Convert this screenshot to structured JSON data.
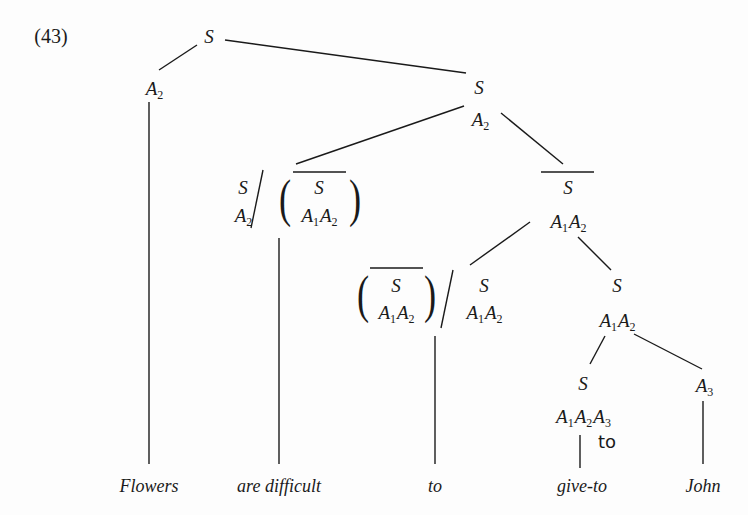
{
  "example_number": "(43)",
  "tree": {
    "root": {
      "cat": "S"
    },
    "left_A2": {
      "cat": "A",
      "sub": "2"
    },
    "s2": {
      "cat": "S",
      "feat": {
        "cat": "A",
        "sub": "2"
      }
    },
    "are_difficult_node": {
      "left": {
        "cat": "S",
        "feat": {
          "cat": "A",
          "sub": "2"
        }
      },
      "slash": "/",
      "paren_open": "(",
      "paren_close": ")",
      "inner": {
        "cat": "S",
        "overlined": true,
        "feat": [
          {
            "cat": "A",
            "sub": "1"
          },
          {
            "cat": "A",
            "sub": "2"
          }
        ]
      }
    },
    "sbar_node": {
      "cat": "S",
      "overlined": true,
      "feat": [
        {
          "cat": "A",
          "sub": "1"
        },
        {
          "cat": "A",
          "sub": "2"
        }
      ]
    },
    "to_node": {
      "paren_open": "(",
      "paren_close": ")",
      "inner": {
        "cat": "S",
        "overlined": true,
        "feat": [
          {
            "cat": "A",
            "sub": "1"
          },
          {
            "cat": "A",
            "sub": "2"
          }
        ]
      },
      "slash": "/",
      "right": {
        "cat": "S",
        "feat": [
          {
            "cat": "A",
            "sub": "1"
          },
          {
            "cat": "A",
            "sub": "2"
          }
        ]
      }
    },
    "s_a1a2_node": {
      "cat": "S",
      "feat": [
        {
          "cat": "A",
          "sub": "1"
        },
        {
          "cat": "A",
          "sub": "2"
        }
      ]
    },
    "giveto_node": {
      "cat": "S",
      "feat": [
        {
          "cat": "A",
          "sub": "1"
        },
        {
          "cat": "A",
          "sub": "2"
        },
        {
          "cat": "A",
          "sub": "3"
        }
      ],
      "annotation": "to"
    },
    "john_node": {
      "cat": "A",
      "sub": "3"
    }
  },
  "words": [
    "Flowers",
    "are difficult",
    "to",
    "give-to",
    "John"
  ]
}
